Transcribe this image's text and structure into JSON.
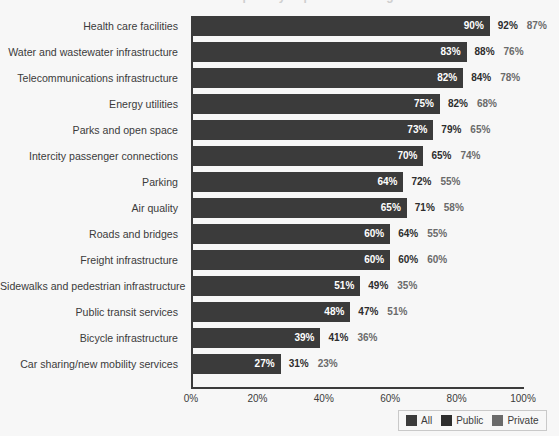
{
  "title_remnant": "Infrastructure priority importance ratings",
  "chart_data": {
    "type": "bar",
    "title": "",
    "xlabel": "",
    "ylabel": "",
    "xlim": [
      0,
      100
    ],
    "xticks": [
      "0%",
      "20%",
      "40%",
      "60%",
      "80%",
      "100%"
    ],
    "xtick_values": [
      0,
      20,
      40,
      60,
      80,
      100
    ],
    "grid": false,
    "legend_position": "bottom-right",
    "bar_series": "All",
    "categories": [
      "Health care facilities",
      "Water and wastewater infrastructure",
      "Telecommunications infrastructure",
      "Energy utilities",
      "Parks and open space",
      "Intercity passenger connections",
      "Parking",
      "Air quality",
      "Roads and bridges",
      "Freight infrastructure",
      "Sidewalks and pedestrian infrastructure",
      "Public transit services",
      "Bicycle infrastructure",
      "Car sharing/new mobility services"
    ],
    "series": [
      {
        "name": "All",
        "values": [
          90,
          83,
          82,
          75,
          73,
          70,
          64,
          65,
          60,
          60,
          51,
          48,
          39,
          27
        ],
        "labels": [
          "90%",
          "83%",
          "82%",
          "75%",
          "73%",
          "70%",
          "64%",
          "65%",
          "60%",
          "60%",
          "51%",
          "48%",
          "39%",
          "27%"
        ],
        "color": "#3b3b3b"
      },
      {
        "name": "Public",
        "values": [
          92,
          88,
          84,
          82,
          79,
          65,
          72,
          71,
          64,
          60,
          49,
          47,
          41,
          31
        ],
        "labels": [
          "92%",
          "88%",
          "84%",
          "82%",
          "79%",
          "65%",
          "72%",
          "71%",
          "64%",
          "60%",
          "49%",
          "47%",
          "41%",
          "31%"
        ],
        "color": "#2d2d2d"
      },
      {
        "name": "Private",
        "values": [
          87,
          76,
          78,
          68,
          65,
          74,
          55,
          58,
          55,
          60,
          35,
          51,
          36,
          23
        ],
        "labels": [
          "87%",
          "76%",
          "78%",
          "68%",
          "65%",
          "74%",
          "55%",
          "58%",
          "55%",
          "60%",
          "35%",
          "51%",
          "36%",
          "23%"
        ],
        "color": "#6a6a6a"
      }
    ]
  },
  "legend": {
    "items": [
      {
        "label": "All",
        "color": "#3b3b3b"
      },
      {
        "label": "Public",
        "color": "#2d2d2d"
      },
      {
        "label": "Private",
        "color": "#6a6a6a"
      }
    ]
  }
}
